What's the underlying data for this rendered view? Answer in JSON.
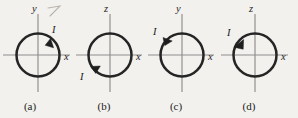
{
  "figure": {
    "background_color": "#f2f1ee",
    "ink_color": "#252525",
    "axis_color": "#8d8d8d",
    "panels": [
      {
        "id": "a",
        "caption": "(a)",
        "vertical_axis_label": "y",
        "horizontal_axis_label": "x",
        "current_label": "I",
        "current_direction": "counterclockwise",
        "arrow_position": "upper-right",
        "label_position": "upper-right-outside"
      },
      {
        "id": "b",
        "caption": "(b)",
        "vertical_axis_label": "z",
        "horizontal_axis_label": "x",
        "current_label": "I",
        "current_direction": "clockwise",
        "arrow_position": "lower-left",
        "label_position": "lower-left-outside"
      },
      {
        "id": "c",
        "caption": "(c)",
        "vertical_axis_label": "y",
        "horizontal_axis_label": "x",
        "current_label": "I",
        "current_direction": "clockwise",
        "arrow_position": "upper-left",
        "label_position": "upper-left-outside"
      },
      {
        "id": "d",
        "caption": "(d)",
        "vertical_axis_label": "z",
        "horizontal_axis_label": "x",
        "current_label": "I",
        "current_direction": "counterclockwise",
        "arrow_position": "upper-left",
        "label_position": "upper-left-outside"
      }
    ]
  }
}
